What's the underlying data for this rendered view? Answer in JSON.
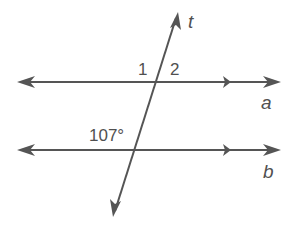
{
  "diagram": {
    "type": "parallel-lines-cut-by-transversal",
    "stroke_color": "#555555",
    "lines": [
      {
        "id": "a",
        "label": "a",
        "kind": "parallel",
        "y": 82
      },
      {
        "id": "b",
        "label": "b",
        "kind": "parallel",
        "y": 150
      },
      {
        "id": "t",
        "label": "t",
        "kind": "transversal"
      }
    ],
    "angles": [
      {
        "label": "1",
        "position": "above line a, left of transversal"
      },
      {
        "label": "2",
        "position": "above line a, right of transversal"
      },
      {
        "label": "107°",
        "position": "above line b, left of transversal"
      }
    ],
    "labels": {
      "t": "t",
      "a": "a",
      "b": "b",
      "angle1": "1",
      "angle2": "2",
      "angle_given": "107°"
    }
  }
}
